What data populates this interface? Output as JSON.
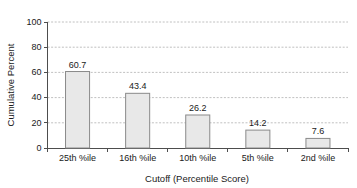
{
  "chart_data": {
    "type": "bar",
    "title": "",
    "subtitle": "",
    "xlabel": "Cutoff (Percentile Score)",
    "ylabel": "Cumulative Percent",
    "categories": [
      "25th %ile",
      "16th %ile",
      "10th %ile",
      "5th %ile",
      "2nd %ile"
    ],
    "values": [
      60.7,
      43.4,
      26.2,
      14.2,
      7.6
    ],
    "value_labels": [
      "60.7",
      "43.4",
      "26.2",
      "14.2",
      "7.6"
    ],
    "ylim": [
      0,
      100
    ],
    "xlim": [
      0,
      5
    ],
    "y_ticks": [
      0,
      20,
      40,
      60,
      80,
      100
    ],
    "y_tick_labels": [
      "0",
      "20",
      "40",
      "60",
      "80",
      "100"
    ],
    "grid": true,
    "grid_axis": "y",
    "grid_style": "dashed",
    "legend": false,
    "legend_position": "none",
    "bar_fill_color": "#e8e8e8",
    "bar_border_color": "#8a8a8a",
    "gridline_color": "#b0b0b0",
    "axis_color": "#4d4d4d",
    "background_color": "#ffffff",
    "show_value_labels": true
  }
}
